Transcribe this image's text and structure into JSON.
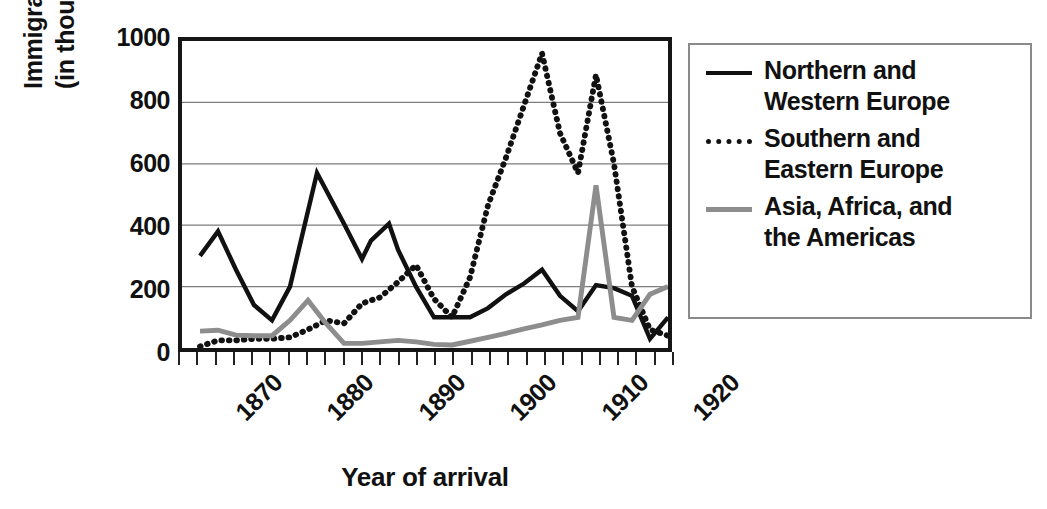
{
  "chart_data": {
    "type": "line",
    "title": "",
    "xlabel": "Year of arrival",
    "ylabel": "Immigrants (in thousands)",
    "ylabel_lines": [
      "Immigrants",
      "(in thousands)"
    ],
    "xlim": [
      1870,
      1924
    ],
    "ylim": [
      0,
      1000
    ],
    "yticks": [
      0,
      200,
      400,
      600,
      800,
      1000
    ],
    "ytick_labels": [
      "0",
      "200",
      "400",
      "600",
      "800",
      "1000"
    ],
    "xticks": [
      1870,
      1880,
      1890,
      1900,
      1910,
      1920
    ],
    "xtick_labels": [
      "1870",
      "1880",
      "1890",
      "1900",
      "1910",
      "1920"
    ],
    "xtick_minor_step": 2,
    "grid": "horizontal",
    "legend_position": "right",
    "series": [
      {
        "name": "Northern and Western Europe",
        "style": "solid",
        "color": "#111111",
        "x": [
          1872,
          1874,
          1876,
          1878,
          1880,
          1882,
          1885,
          1888,
          1890,
          1891,
          1893,
          1894,
          1896,
          1898,
          1900,
          1902,
          1904,
          1906,
          1908,
          1910,
          1912,
          1914,
          1916,
          1918,
          1920,
          1922,
          1924
        ],
        "values": [
          300,
          380,
          255,
          140,
          90,
          200,
          570,
          405,
          290,
          350,
          405,
          320,
          200,
          100,
          100,
          100,
          130,
          175,
          210,
          255,
          170,
          120,
          205,
          195,
          170,
          30,
          100
        ]
      },
      {
        "name": "Southern and Eastern Europe",
        "style": "dotted",
        "color": "#111111",
        "x": [
          1872,
          1874,
          1876,
          1878,
          1880,
          1882,
          1884,
          1886,
          1888,
          1890,
          1892,
          1894,
          1896,
          1898,
          1900,
          1902,
          1904,
          1906,
          1908,
          1910,
          1912,
          1914,
          1916,
          1918,
          1920,
          1922,
          1924
        ],
        "values": [
          5,
          25,
          25,
          30,
          30,
          35,
          60,
          90,
          80,
          145,
          165,
          215,
          270,
          160,
          100,
          230,
          465,
          620,
          790,
          960,
          700,
          570,
          890,
          600,
          200,
          60,
          40
        ]
      },
      {
        "name": "Asia, Africa, and the Americas",
        "style": "solid",
        "color": "#8d8d8d",
        "x": [
          1872,
          1874,
          1876,
          1878,
          1880,
          1882,
          1884,
          1886,
          1888,
          1890,
          1892,
          1894,
          1896,
          1898,
          1900,
          1902,
          1904,
          1906,
          1908,
          1910,
          1912,
          1914,
          1916,
          1918,
          1920,
          1922,
          1924
        ],
        "values": [
          55,
          58,
          42,
          40,
          40,
          90,
          155,
          80,
          15,
          15,
          20,
          25,
          20,
          12,
          10,
          22,
          35,
          48,
          62,
          75,
          90,
          100,
          530,
          100,
          90,
          175,
          200
        ]
      }
    ]
  },
  "legend": {
    "items": [
      {
        "label_lines": [
          "Northern and",
          "Western Europe"
        ],
        "style": "solid-black"
      },
      {
        "label_lines": [
          "Southern and",
          "Eastern Europe"
        ],
        "style": "dotted-black"
      },
      {
        "label_lines": [
          "Asia, Africa, and",
          "the Americas"
        ],
        "style": "solid-gray"
      }
    ]
  }
}
